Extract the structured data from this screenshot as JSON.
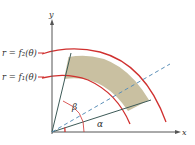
{
  "diagram": {
    "type": "polar-region",
    "axes": {
      "x_label": "x",
      "y_label": "y"
    },
    "curves": [
      {
        "id": "outer",
        "label": "r = f₂(θ)",
        "color": "#d0302f"
      },
      {
        "id": "inner",
        "label": "r = f₁(θ)",
        "color": "#d0302f"
      }
    ],
    "angles": {
      "alpha": "α",
      "beta": "β"
    },
    "region_fill": "#c9c0a1",
    "dashed_ray_color": "#5b8fb8",
    "ray_color": "#3d5a57"
  }
}
